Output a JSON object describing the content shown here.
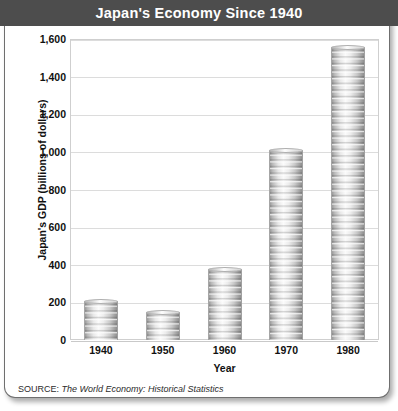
{
  "header": {
    "title": "Japan's Economy Since 1940",
    "band_color": "#4d4d4d",
    "title_color": "#ffffff"
  },
  "source": {
    "label": "SOURCE:",
    "citation": "The World Economy: Historical Statistics"
  },
  "chart_data": {
    "type": "bar",
    "title": "Japan's Economy Since 1940",
    "categories": [
      "1940",
      "1950",
      "1960",
      "1970",
      "1980"
    ],
    "values": [
      205,
      150,
      375,
      1010,
      1560
    ],
    "xlabel": "Year",
    "ylabel": "Japan's GDP (billions of dollars)",
    "ylim": [
      0,
      1600
    ],
    "ytick_values": [
      0,
      200,
      400,
      600,
      800,
      1000,
      1200,
      1400,
      1600
    ],
    "ytick_labels": [
      "0",
      "200",
      "400",
      "600",
      "800",
      "1,000",
      "1,200",
      "1,400",
      "1,600"
    ],
    "grid": true,
    "legend": null,
    "bar_style": "stacked-coins",
    "bar_color": "#d9d9d9",
    "grid_color": "#dcdcdc",
    "plot_border_color": "#cfcfcf"
  }
}
